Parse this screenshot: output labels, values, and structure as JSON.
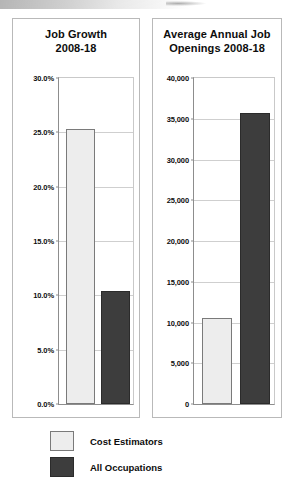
{
  "page": {
    "background_color": "#ffffff",
    "artifact": "scan-smudge-top-edge"
  },
  "legend": {
    "position": "below-charts",
    "entries": [
      {
        "label": "Cost Estimators",
        "color": "#ededed",
        "swatch": "light-square-swatch"
      },
      {
        "label": "All Occupations",
        "color": "#3d3d3d",
        "swatch": "dark-square-swatch"
      }
    ]
  },
  "chart_data": [
    {
      "id": "job-growth",
      "type": "bar",
      "title": "Job Growth 2008-18",
      "title_lines": [
        "Job Growth",
        "2008-18"
      ],
      "xlabel": "",
      "ylabel": "",
      "categories": [
        "Cost Estimators",
        "All Occupations"
      ],
      "values": [
        25.3,
        10.4
      ],
      "value_labels": [
        "25.3%",
        "10.4%"
      ],
      "series": [
        {
          "name": "Cost Estimators",
          "values": [
            25.3
          ],
          "color": "#ededed"
        },
        {
          "name": "All Occupations",
          "values": [
            10.4
          ],
          "color": "#3d3d3d"
        }
      ],
      "ylim": [
        0,
        30
      ],
      "yticks": [
        0,
        5,
        10,
        15,
        20,
        25,
        30
      ],
      "ytick_labels": [
        "0.0%",
        "5.0%",
        "10.0%",
        "15.0%",
        "20.0%",
        "25.0%",
        "30.0%"
      ],
      "grid": true,
      "legend_position": "external-bottom"
    },
    {
      "id": "average-annual-job-openings",
      "type": "bar",
      "title": "Average Annual Job Openings 2008-18",
      "title_lines": [
        "Average Annual Job",
        "Openings 2008-18"
      ],
      "xlabel": "",
      "ylabel": "",
      "categories": [
        "Cost Estimators",
        "All Occupations"
      ],
      "values": [
        10500,
        35700
      ],
      "value_labels": [
        "10,500",
        "35,700"
      ],
      "series": [
        {
          "name": "Cost Estimators",
          "values": [
            10500
          ],
          "color": "#ededed"
        },
        {
          "name": "All Occupations",
          "values": [
            35700
          ],
          "color": "#3d3d3d"
        }
      ],
      "ylim": [
        0,
        40000
      ],
      "yticks": [
        0,
        5000,
        10000,
        15000,
        20000,
        25000,
        30000,
        35000,
        40000
      ],
      "ytick_labels": [
        "0",
        "5,000",
        "10,000",
        "15,000",
        "20,000",
        "25,000",
        "30,000",
        "35,000",
        "40,000"
      ],
      "grid": true,
      "legend_position": "external-bottom"
    }
  ]
}
